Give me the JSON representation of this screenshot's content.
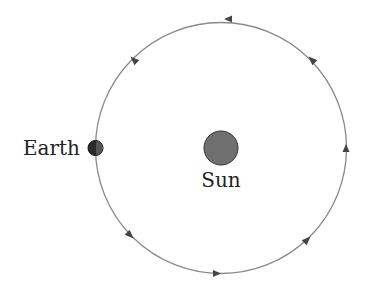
{
  "diagram": {
    "title": "",
    "labels": {
      "earth": "Earth",
      "sun": "Sun"
    },
    "colors": {
      "orbit": "#8a8a8a",
      "sun": "#707070",
      "earth": "#2a2a2a",
      "arrow": "#444444",
      "text": "#222222"
    },
    "orbit_direction": "counterclockwise"
  }
}
